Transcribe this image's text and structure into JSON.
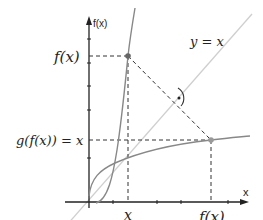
{
  "diagram": {
    "type": "inverse-function-reflection",
    "axes": {
      "y_label": "f(x)",
      "x_label": "x"
    },
    "labels": {
      "line_label": "y = x",
      "fx_left": "f(x)",
      "gfx_left": "g(f(x)) = x",
      "x_bottom": "x",
      "fx_bottom": "f(x)"
    },
    "curves": [
      {
        "name": "f",
        "description": "steep increasing curve through origin"
      },
      {
        "name": "g",
        "description": "inverse of f, reflection over y = x"
      },
      {
        "name": "identity",
        "description": "line y = x"
      }
    ],
    "points": [
      {
        "name": "point-on-f",
        "coords": "(x, f(x))"
      },
      {
        "name": "point-on-g",
        "coords": "(f(x), x)"
      }
    ],
    "annotations": [
      "right-angle marker between dashed segment and y = x"
    ],
    "colors": {
      "axis": "#222222",
      "curve": "#888888",
      "identity_line": "#cccccc",
      "dashed": "#333333"
    }
  }
}
